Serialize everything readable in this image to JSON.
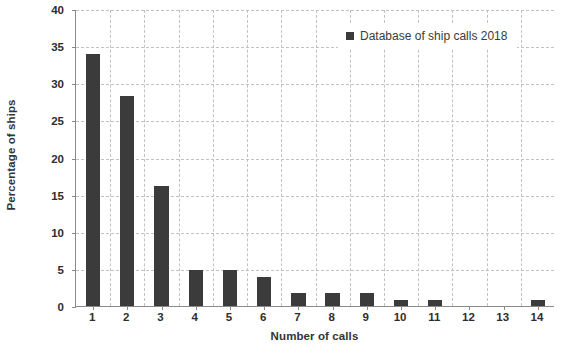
{
  "chart_data": {
    "type": "bar",
    "title": "",
    "xlabel": "Number of calls",
    "ylabel": "Percentage of ships",
    "categories": [
      "1",
      "2",
      "3",
      "4",
      "5",
      "6",
      "7",
      "8",
      "9",
      "10",
      "11",
      "12",
      "13",
      "14"
    ],
    "values": [
      34.0,
      28.3,
      16.2,
      4.9,
      4.9,
      3.9,
      1.7,
      1.7,
      1.7,
      0.8,
      0.8,
      0.0,
      0.0,
      0.8
    ],
    "series": [
      {
        "name": "Database of ship calls 2018",
        "values": [
          34.0,
          28.3,
          16.2,
          4.9,
          4.9,
          3.9,
          1.7,
          1.7,
          1.7,
          0.8,
          0.8,
          0.0,
          0.0,
          0.8
        ],
        "color": "#3b3b3b"
      }
    ],
    "ylim": [
      0,
      40
    ],
    "yticks": [
      0,
      5,
      10,
      15,
      20,
      25,
      30,
      35,
      40
    ],
    "ytick_labels": [
      "0",
      "5",
      "10",
      "15",
      "20",
      "25",
      "30",
      "35",
      "40"
    ],
    "grid": true,
    "grid_style": "dashed",
    "grid_color": "#c2c2c2",
    "legend": {
      "position": "top-right",
      "entries": [
        {
          "label": "Database of ship calls 2018",
          "color": "#3b3b3b",
          "marker": "square"
        }
      ]
    },
    "bar_color": "#3b3b3b",
    "axis_color": "#8a8a8a",
    "background": "#ffffff"
  }
}
